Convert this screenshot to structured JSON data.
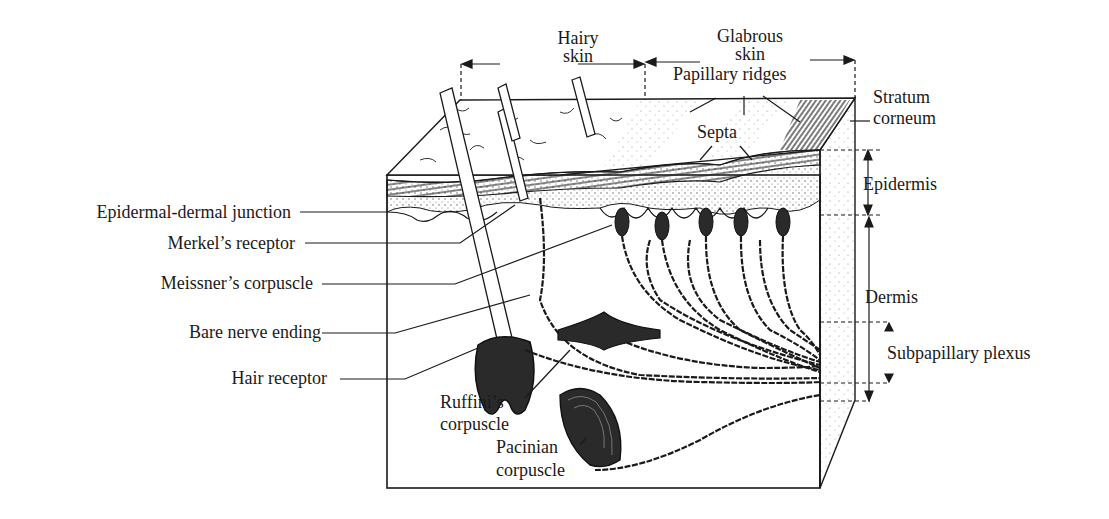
{
  "regions": {
    "hairy_skin": "Hairy\nskin",
    "hairy_skin_line1": "Hairy",
    "hairy_skin_line2": "skin",
    "glabrous_skin_line1": "Glabrous",
    "glabrous_skin_line2": "skin"
  },
  "labels": {
    "papillary_ridges": "Papillary ridges",
    "septa": "Septa",
    "stratum_corneum_line1": "Stratum",
    "stratum_corneum_line2": "corneum",
    "epidermis": "Epidermis",
    "dermis": "Dermis",
    "subpapillary_plexus": "Subpapillary plexus",
    "epidermal_dermal_junction": "Epidermal-dermal junction",
    "merkels_receptor": "Merkel’s receptor",
    "meissners_corpuscle": "Meissner’s corpuscle",
    "bare_nerve_ending": "Bare nerve ending",
    "hair_receptor": "Hair receptor",
    "ruffinis_corpuscle_line1": "Ruffini’s",
    "ruffinis_corpuscle_line2": "corpuscle",
    "pacinian_corpuscle_line1": "Pacinian",
    "pacinian_corpuscle_line2": "corpuscle"
  },
  "colors": {
    "ink": "#1a1a1a",
    "background": "#ffffff",
    "stipple": "#9a9a9a"
  }
}
